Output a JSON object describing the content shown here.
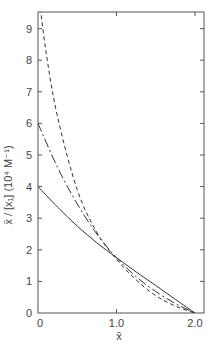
{
  "chart_data": {
    "type": "line",
    "title": "",
    "xlabel": "x̄",
    "ylabel": "x̄ / [x₁]  (10⁴ M⁻¹)",
    "xlim": [
      0,
      2.0
    ],
    "ylim": [
      0,
      9.5
    ],
    "x_ticks": [
      "0",
      "1.0",
      "2.0"
    ],
    "y_ticks": [
      "0",
      "1",
      "2",
      "3",
      "4",
      "5",
      "6",
      "7",
      "8",
      "9"
    ],
    "grid": false,
    "legend": null,
    "series": [
      {
        "name": "solid",
        "style": "solid",
        "x": [
          0,
          0.25,
          0.5,
          0.75,
          1.0,
          1.25,
          1.5,
          1.75,
          2.0
        ],
        "y": [
          4.0,
          3.35,
          2.75,
          2.22,
          1.75,
          1.3,
          0.87,
          0.43,
          0.0
        ]
      },
      {
        "name": "dash-dot",
        "style": "dashdot",
        "x": [
          0,
          0.25,
          0.5,
          0.75,
          1.0,
          1.25,
          1.5,
          1.75,
          2.0
        ],
        "y": [
          6.0,
          4.6,
          3.45,
          2.5,
          1.75,
          1.15,
          0.68,
          0.3,
          0.0
        ]
      },
      {
        "name": "dashed",
        "style": "dashed",
        "x": [
          0,
          0.1,
          0.25,
          0.5,
          0.75,
          1.0,
          1.25,
          1.5,
          1.75,
          2.0
        ],
        "y": [
          10.3,
          8.3,
          6.2,
          3.9,
          2.55,
          1.7,
          1.05,
          0.55,
          0.22,
          0.0
        ]
      }
    ]
  }
}
